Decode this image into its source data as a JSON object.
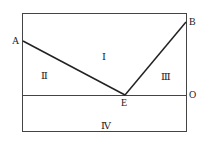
{
  "diagram": {
    "points": {
      "A": {
        "label": "A",
        "x": 23,
        "y": 41
      },
      "B": {
        "label": "B",
        "x": 186,
        "y": 22
      },
      "E": {
        "label": "E",
        "x": 125,
        "y": 95
      },
      "O": {
        "label": "O",
        "x": 186,
        "y": 95
      }
    },
    "regions": {
      "I": "Ⅰ",
      "II": "Ⅱ",
      "III": "Ⅲ",
      "IV": "Ⅳ"
    },
    "line_color": "#333333"
  }
}
